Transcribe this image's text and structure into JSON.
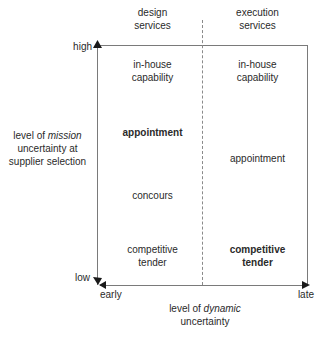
{
  "columns": [
    {
      "header_line1": "design",
      "header_line2": "services"
    },
    {
      "header_line1": "execution",
      "header_line2": "services"
    }
  ],
  "y_axis": {
    "high_label": "high",
    "low_label": "low",
    "title_line1_prefix": "level of ",
    "title_line1_italic": "mission",
    "title_line2": "uncertainty at",
    "title_line3": "supplier selection"
  },
  "x_axis": {
    "early_label": "early",
    "late_label": "late",
    "title_line1_prefix": "level of ",
    "title_line1_italic": "dynamic",
    "title_line2": "uncertainty"
  },
  "cells": {
    "design": [
      {
        "line1": "in-house",
        "line2": "capability",
        "bold": false
      },
      {
        "line1": "appointment",
        "line2": "",
        "bold": true
      },
      {
        "line1": "concours",
        "line2": "",
        "bold": false
      },
      {
        "line1": "competitive",
        "line2": "tender",
        "bold": false
      }
    ],
    "execution": [
      {
        "line1": "in-house",
        "line2": "capability",
        "bold": false
      },
      {
        "line1": "appointment",
        "line2": "",
        "bold": false
      },
      {
        "line1": "competitive",
        "line2": "tender",
        "bold": true
      }
    ]
  },
  "colors": {
    "axis": "#7a7a7a",
    "text": "#2a2a2a"
  }
}
